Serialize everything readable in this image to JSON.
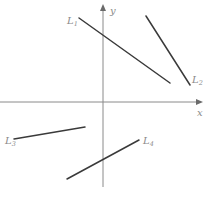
{
  "diagram": {
    "axes": {
      "x_label": "x",
      "y_label": "y",
      "origin": [
        103,
        102
      ],
      "axis_color": "#8a8a8a"
    },
    "lines": [
      {
        "name": "L",
        "sub": "1",
        "x1": 79,
        "y1": 18,
        "x2": 170,
        "y2": 83,
        "label_x": 67,
        "label_y": 24,
        "slope": "negative"
      },
      {
        "name": "L",
        "sub": "2",
        "x1": 146,
        "y1": 16,
        "x2": 190,
        "y2": 85,
        "label_x": 192,
        "label_y": 83,
        "slope": "negative"
      },
      {
        "name": "L",
        "sub": "3",
        "x1": 14,
        "y1": 139,
        "x2": 85,
        "y2": 127,
        "label_x": 5,
        "label_y": 144,
        "slope": "positive"
      },
      {
        "name": "L",
        "sub": "4",
        "x1": 67,
        "y1": 179,
        "x2": 139,
        "y2": 140,
        "label_x": 143,
        "label_y": 144,
        "slope": "positive"
      }
    ],
    "line_color": "#3a3a3a"
  }
}
